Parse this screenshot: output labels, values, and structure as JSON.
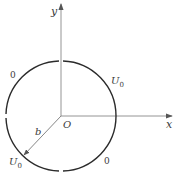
{
  "diagram": {
    "axes": {
      "x_label": "x",
      "y_label": "y",
      "origin_label": "O"
    },
    "radius_label": "b",
    "segments": [
      {
        "quadrant": "I",
        "potential": "U",
        "subscript": "0"
      },
      {
        "quadrant": "II",
        "potential": "0"
      },
      {
        "quadrant": "III",
        "potential": "U",
        "subscript": "0"
      },
      {
        "quadrant": "IV",
        "potential": "0"
      }
    ],
    "colors": {
      "stroke": "#2b2b2b",
      "axis": "#7a7a7a"
    }
  }
}
